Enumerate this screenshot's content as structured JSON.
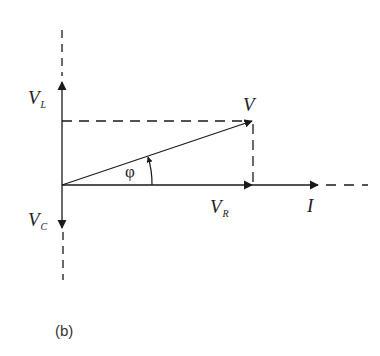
{
  "figure": {
    "caption": "(b)",
    "type": "phasor diagram (series RLC circuit)"
  },
  "labels": {
    "VL": {
      "main": "V",
      "sub": "L"
    },
    "VC": {
      "main": "V",
      "sub": "C"
    },
    "V": {
      "main": "V"
    },
    "VR": {
      "main": "V",
      "sub": "R"
    },
    "I": {
      "main": "I"
    },
    "phi": {
      "main": "φ"
    }
  },
  "geometry": {
    "origin": [
      62,
      185
    ],
    "vertical_axis_x": 62,
    "VL_tip": [
      62,
      82
    ],
    "VC_tip": [
      62,
      228
    ],
    "V_tip": [
      252,
      121
    ],
    "VR_tip": [
      252,
      185
    ],
    "I_tip": [
      318,
      185
    ]
  },
  "colors": {
    "ink": "#1a1a1a",
    "background": "#ffffff"
  }
}
